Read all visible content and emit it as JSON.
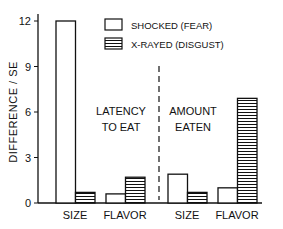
{
  "chart_data": {
    "type": "bar",
    "title": "",
    "ylabel": "DIFFERENCE / SE",
    "xlabel": "",
    "ylim": [
      0,
      12
    ],
    "yticks": [
      0,
      3,
      6,
      9,
      12
    ],
    "grid": false,
    "legend_position": "top-right",
    "panels": [
      {
        "label": "LATENCY TO EAT",
        "label_lines": [
          "LATENCY",
          "TO EAT"
        ],
        "categories": [
          "SIZE",
          "FLAVOR"
        ],
        "series": [
          {
            "name": "SHOCKED (FEAR)",
            "values": [
              12.0,
              0.6
            ]
          },
          {
            "name": "X-RAYED (DISGUST)",
            "values": [
              0.7,
              1.7
            ]
          }
        ]
      },
      {
        "label": "AMOUNT EATEN",
        "label_lines": [
          "AMOUNT",
          "EATEN"
        ],
        "categories": [
          "SIZE",
          "FLAVOR"
        ],
        "series": [
          {
            "name": "SHOCKED (FEAR)",
            "values": [
              1.9,
              1.0
            ]
          },
          {
            "name": "X-RAYED (DISGUST)",
            "values": [
              0.7,
              6.9
            ]
          }
        ]
      }
    ],
    "legend": [
      {
        "name": "SHOCKED (FEAR)",
        "pattern": "open"
      },
      {
        "name": "X-RAYED (DISGUST)",
        "pattern": "horizontal-hatch"
      }
    ],
    "colors": {
      "ink": "#111111",
      "background": "#ffffff"
    }
  }
}
